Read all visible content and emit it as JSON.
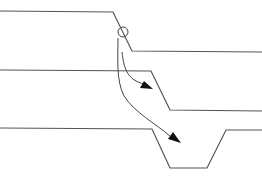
{
  "diagram": {
    "title": "",
    "elements": [
      {
        "id": "profile-top",
        "type": "polyline",
        "label": "upper step profile"
      },
      {
        "id": "profile-middle",
        "type": "polyline",
        "label": "middle step profile"
      },
      {
        "id": "profile-bottom",
        "type": "polyline",
        "label": "lower trench profile"
      },
      {
        "id": "origin-marker",
        "type": "circle",
        "label": "origin point on upper slope"
      },
      {
        "id": "arrow-to-middle",
        "type": "curved-arrow",
        "from": "origin-marker",
        "to": "profile-middle"
      },
      {
        "id": "arrow-to-bottom",
        "type": "curved-arrow",
        "from": "origin-marker",
        "to": "profile-bottom"
      }
    ],
    "colors": {
      "line": "#555555",
      "arrow": "#444444",
      "arrowhead": "#111111",
      "background": "#ffffff"
    }
  }
}
